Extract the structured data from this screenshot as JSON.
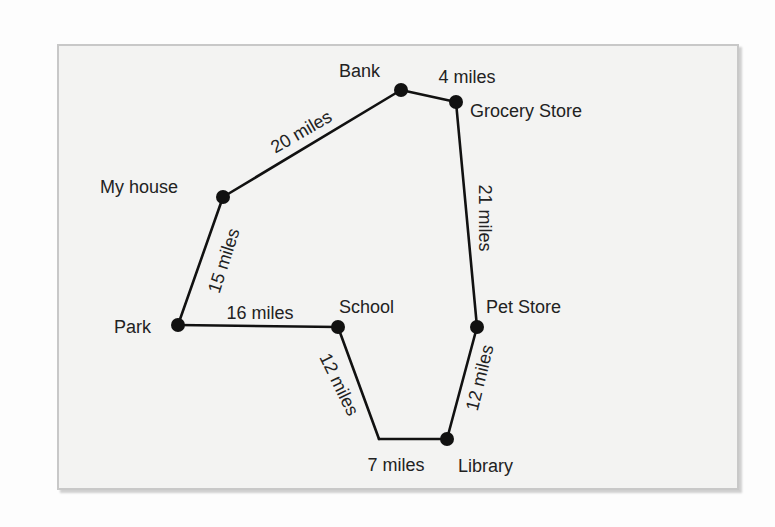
{
  "diagram": {
    "type": "route-map",
    "colors": {
      "background": "#fdfdfd",
      "panel": "#f3f3f2",
      "panel_border": "#c8c8c8",
      "ink": "#111111",
      "text": "#222222"
    },
    "locations": [
      {
        "id": "bank",
        "label": "Bank",
        "x": 401,
        "y": 90,
        "dot": true,
        "lx": 339,
        "ly": 77
      },
      {
        "id": "grocery",
        "label": "Grocery Store",
        "x": 456,
        "y": 102,
        "dot": true,
        "lx": 470,
        "ly": 117
      },
      {
        "id": "house",
        "label": "My house",
        "x": 223,
        "y": 197,
        "dot": true,
        "lx": 100,
        "ly": 193
      },
      {
        "id": "park",
        "label": "Park",
        "x": 178,
        "y": 325,
        "dot": true,
        "lx": 114,
        "ly": 333
      },
      {
        "id": "school",
        "label": "School",
        "x": 338,
        "y": 327,
        "dot": true,
        "lx": 339,
        "ly": 313
      },
      {
        "id": "petstore",
        "label": "Pet Store",
        "x": 477,
        "y": 327,
        "dot": true,
        "lx": 486,
        "ly": 313
      },
      {
        "id": "corner",
        "label": "",
        "x": 379,
        "y": 439,
        "dot": false
      },
      {
        "id": "library",
        "label": "Library",
        "x": 447,
        "y": 439,
        "dot": true,
        "lx": 458,
        "ly": 472
      }
    ],
    "routes": [
      {
        "from": "house",
        "to": "bank",
        "distance": "20 miles",
        "cx": 302,
        "cy": 133,
        "angle": -30
      },
      {
        "from": "bank",
        "to": "grocery",
        "distance": "4 miles",
        "cx": 467,
        "cy": 78,
        "angle": 0
      },
      {
        "from": "grocery",
        "to": "petstore",
        "distance": "21 miles",
        "cx": 484,
        "cy": 218,
        "angle": 90
      },
      {
        "from": "house",
        "to": "park",
        "distance": "15 miles",
        "cx": 225,
        "cy": 261,
        "angle": -72
      },
      {
        "from": "park",
        "to": "school",
        "distance": "16 miles",
        "cx": 260,
        "cy": 314,
        "angle": 0
      },
      {
        "from": "school",
        "to": "corner",
        "distance": "12 miles",
        "cx": 338,
        "cy": 385,
        "angle": 64
      },
      {
        "from": "corner",
        "to": "library",
        "distance": "7 miles",
        "cx": 396,
        "cy": 466,
        "angle": 0
      },
      {
        "from": "petstore",
        "to": "library",
        "distance": "12 miles",
        "cx": 481,
        "cy": 378,
        "angle": -76
      }
    ]
  }
}
